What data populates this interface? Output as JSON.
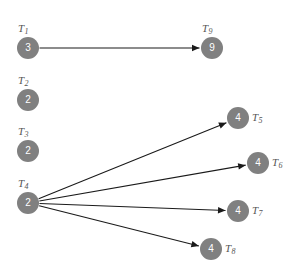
{
  "diagram": {
    "type": "directed-graph",
    "canvas": {
      "width": 303,
      "height": 271,
      "background": "#ffffff"
    },
    "style": {
      "node_fill": "#808080",
      "node_text_color": "#ffffff",
      "label_color": "#555555",
      "edge_color": "#1a1a1a",
      "node_radius": 11,
      "edge_width": 1.1
    },
    "nodes": [
      {
        "id": "T1",
        "label": "T",
        "subscript": "1",
        "value": "3",
        "cx": 28,
        "cy": 48,
        "label_pos": "above"
      },
      {
        "id": "T2",
        "label": "T",
        "subscript": "2",
        "value": "2",
        "cx": 28,
        "cy": 100,
        "label_pos": "above"
      },
      {
        "id": "T3",
        "label": "T",
        "subscript": "3",
        "value": "2",
        "cx": 28,
        "cy": 151,
        "label_pos": "above"
      },
      {
        "id": "T4",
        "label": "T",
        "subscript": "4",
        "value": "2",
        "cx": 28,
        "cy": 203,
        "label_pos": "above"
      },
      {
        "id": "T5",
        "label": "T",
        "subscript": "5",
        "value": "4",
        "cx": 238,
        "cy": 118,
        "label_pos": "right"
      },
      {
        "id": "T6",
        "label": "T",
        "subscript": "6",
        "value": "4",
        "cx": 258,
        "cy": 163,
        "label_pos": "right"
      },
      {
        "id": "T7",
        "label": "T",
        "subscript": "7",
        "value": "4",
        "cx": 238,
        "cy": 211,
        "label_pos": "right"
      },
      {
        "id": "T8",
        "label": "T",
        "subscript": "8",
        "value": "4",
        "cx": 211,
        "cy": 249,
        "label_pos": "right"
      },
      {
        "id": "T9",
        "label": "T",
        "subscript": "9",
        "value": "9",
        "cx": 212,
        "cy": 48,
        "label_pos": "above"
      }
    ],
    "edges": [
      {
        "from": "T1",
        "to": "T9",
        "directed": true
      },
      {
        "from": "T4",
        "to": "T5",
        "directed": true
      },
      {
        "from": "T4",
        "to": "T6",
        "directed": true
      },
      {
        "from": "T4",
        "to": "T7",
        "directed": true
      },
      {
        "from": "T4",
        "to": "T8",
        "directed": true
      }
    ]
  }
}
